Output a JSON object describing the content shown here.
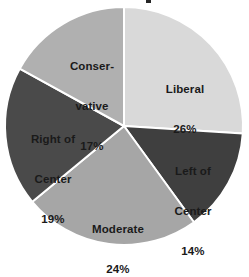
{
  "chart_data": {
    "type": "pie",
    "title": "",
    "labels": [
      "Liberal",
      "Left of Center",
      "Moderate",
      "Right of Center",
      "Conservative"
    ],
    "values": [
      26,
      14,
      24,
      19,
      17
    ],
    "value_suffix": "%",
    "legend": "none",
    "grid": false,
    "start_angle_deg": 0,
    "direction": "clockwise",
    "slices": [
      {
        "label": "Liberal",
        "label_line1": "Liberal",
        "label_line2": "",
        "value": 26,
        "value_text": "26%",
        "color": "#d9d9d9",
        "start_deg": 0,
        "end_deg": 93.6
      },
      {
        "label": "Left of Center",
        "label_line1": "Left of",
        "label_line2": "Center",
        "value": 14,
        "value_text": "14%",
        "color": "#3f3f3f",
        "start_deg": 93.6,
        "end_deg": 144.0
      },
      {
        "label": "Moderate",
        "label_line1": "Moderate",
        "label_line2": "",
        "value": 24,
        "value_text": "24%",
        "color": "#a6a6a6",
        "start_deg": 144.0,
        "end_deg": 230.4
      },
      {
        "label": "Right of Center",
        "label_line1": "Right of",
        "label_line2": "Center",
        "value": 19,
        "value_text": "19%",
        "color": "#4a4a4a",
        "start_deg": 230.4,
        "end_deg": 298.8
      },
      {
        "label": "Conservative",
        "label_line1": "Conser-",
        "label_line2": "vative",
        "value": 17,
        "value_text": "17%",
        "color": "#b0b0b0",
        "start_deg": 298.8,
        "end_deg": 360.0
      }
    ],
    "separator_color": "#ffffff",
    "label_text_color": "#1a1a1a",
    "background_color": "#ffffff"
  },
  "geometry": {
    "center_x": 124,
    "center_y": 126,
    "radius": 119
  }
}
